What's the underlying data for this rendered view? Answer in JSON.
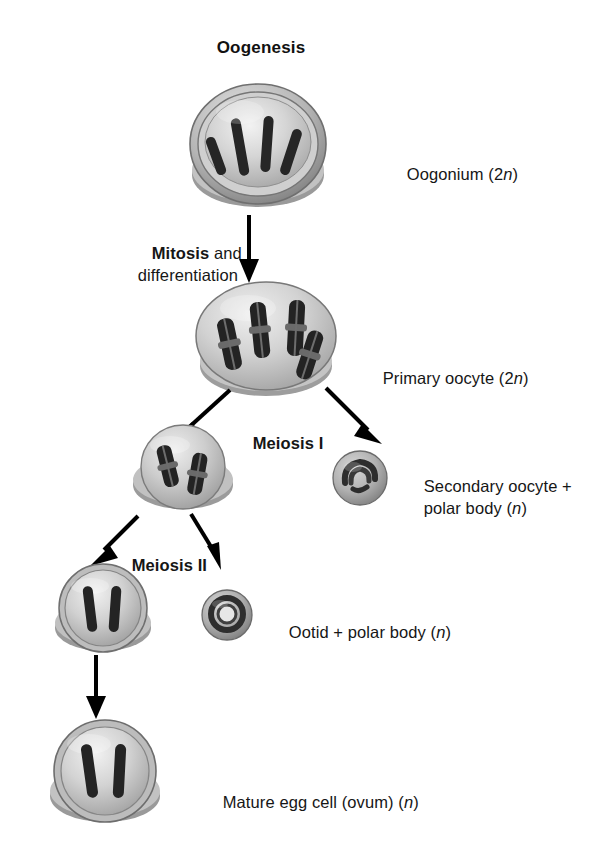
{
  "title": "Oogenesis",
  "labels": {
    "oogonium": "Oogonium (2",
    "oogonium_n": "n",
    "oogonium_tail": ")",
    "mitosis_bold": "Mitosis",
    "mitosis_rest": " and",
    "differentiation": "differentiation",
    "primary_oocyte": "Primary oocyte (2",
    "primary_oocyte_n": "n",
    "primary_oocyte_tail": ")",
    "meiosis_one": "Meiosis I",
    "secondary_line1": "Secondary oocyte +",
    "secondary_line2": "polar body (",
    "secondary_n": "n",
    "secondary_tail": ")",
    "meiosis_two": "Meiosis II",
    "ootid": "Ootid + polar body (",
    "ootid_n": "n",
    "ootid_tail": ")",
    "mature_egg": "Mature egg cell (ovum) (",
    "mature_egg_n": "n",
    "mature_egg_tail": ")"
  },
  "stages": [
    {
      "id": "oogonium",
      "name": "Oogonium",
      "ploidy": "2n",
      "chromosome_count": 4,
      "chromosome_form": "single-rod",
      "label": "Oogonium (2n)"
    },
    {
      "id": "primary-oocyte",
      "name": "Primary oocyte",
      "ploidy": "2n",
      "chromosome_count": 4,
      "chromosome_form": "duplicated",
      "label": "Primary oocyte (2n)"
    },
    {
      "id": "secondary-oocyte",
      "name": "Secondary oocyte",
      "ploidy": "n",
      "chromosome_count": 2,
      "chromosome_form": "duplicated",
      "label": "Secondary oocyte + polar body (n)"
    },
    {
      "id": "first-polar-body",
      "name": "First polar body",
      "ploidy": "n",
      "chromosome_count": 2,
      "chromosome_form": "condensed",
      "label": "polar body (n)"
    },
    {
      "id": "ootid",
      "name": "Ootid",
      "ploidy": "n",
      "chromosome_count": 2,
      "chromosome_form": "single-rod",
      "label": "Ootid + polar body (n)"
    },
    {
      "id": "second-polar-body",
      "name": "Second polar body",
      "ploidy": "n",
      "chromosome_count": 2,
      "chromosome_form": "condensed",
      "label": "polar body (n)"
    },
    {
      "id": "mature-egg",
      "name": "Mature egg cell (ovum)",
      "ploidy": "n",
      "chromosome_count": 2,
      "chromosome_form": "single-rod",
      "label": "Mature egg cell (ovum) (n)"
    }
  ],
  "transitions": [
    {
      "id": "mitosis",
      "label": "Mitosis and differentiation",
      "from": "oogonium",
      "to": "primary-oocyte"
    },
    {
      "id": "meiosis-i",
      "label": "Meiosis I",
      "from": "primary-oocyte",
      "to": "secondary-oocyte + first-polar-body"
    },
    {
      "id": "meiosis-ii",
      "label": "Meiosis II",
      "from": "secondary-oocyte",
      "to": "ootid + second-polar-body"
    },
    {
      "id": "maturation",
      "label": "",
      "from": "ootid",
      "to": "mature-egg"
    }
  ],
  "colors": {
    "background": "#ffffff",
    "text": "#161616",
    "cell_cytoplasm": "#c9c9c9",
    "cell_membrane": "#8d8d8d",
    "chromosome": "#2b2b2b",
    "arrow": "#000000"
  }
}
